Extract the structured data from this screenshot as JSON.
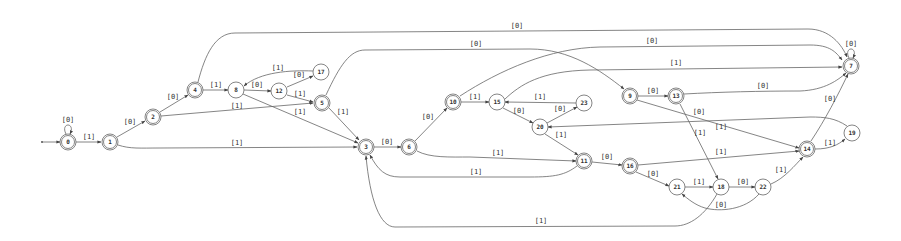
{
  "diagram": {
    "type": "finite-state-automaton",
    "start_state": "0",
    "states": [
      {
        "id": "0",
        "x": 68,
        "y": 142,
        "accepting": true
      },
      {
        "id": "1",
        "x": 110,
        "y": 142,
        "accepting": true
      },
      {
        "id": "2",
        "x": 153,
        "y": 117,
        "accepting": true
      },
      {
        "id": "4",
        "x": 195,
        "y": 90,
        "accepting": true
      },
      {
        "id": "8",
        "x": 236,
        "y": 90,
        "accepting": false
      },
      {
        "id": "12",
        "x": 279,
        "y": 91,
        "accepting": false
      },
      {
        "id": "17",
        "x": 321,
        "y": 72,
        "accepting": false
      },
      {
        "id": "5",
        "x": 322,
        "y": 103,
        "accepting": true
      },
      {
        "id": "3",
        "x": 366,
        "y": 147,
        "accepting": true
      },
      {
        "id": "6",
        "x": 409,
        "y": 147,
        "accepting": true
      },
      {
        "id": "10",
        "x": 453,
        "y": 102,
        "accepting": true
      },
      {
        "id": "15",
        "x": 497,
        "y": 102,
        "accepting": false
      },
      {
        "id": "23",
        "x": 584,
        "y": 103,
        "accepting": false
      },
      {
        "id": "20",
        "x": 540,
        "y": 127,
        "accepting": false
      },
      {
        "id": "11",
        "x": 584,
        "y": 161,
        "accepting": true
      },
      {
        "id": "16",
        "x": 630,
        "y": 166,
        "accepting": true
      },
      {
        "id": "21",
        "x": 677,
        "y": 187,
        "accepting": false
      },
      {
        "id": "18",
        "x": 721,
        "y": 187,
        "accepting": false
      },
      {
        "id": "22",
        "x": 763,
        "y": 187,
        "accepting": false
      },
      {
        "id": "9",
        "x": 630,
        "y": 96,
        "accepting": true
      },
      {
        "id": "13",
        "x": 676,
        "y": 96,
        "accepting": true
      },
      {
        "id": "14",
        "x": 807,
        "y": 149,
        "accepting": true
      },
      {
        "id": "19",
        "x": 852,
        "y": 133,
        "accepting": false
      },
      {
        "id": "7",
        "x": 851,
        "y": 66,
        "accepting": true
      }
    ],
    "edges": [
      {
        "from": "0",
        "to": "0",
        "label": "[0]",
        "path": "M66,134 C60,122 76,122 70,134",
        "lx": 68,
        "ly": 122
      },
      {
        "from": "0",
        "to": "1",
        "label": "[1]",
        "path": "M76,142 L101,142",
        "lx": 89,
        "ly": 139
      },
      {
        "from": "1",
        "to": "2",
        "label": "[0]",
        "path": "M117,137 L145,121",
        "lx": 130,
        "ly": 124
      },
      {
        "from": "1",
        "to": "3",
        "label": "[1]",
        "path": "M118,145 C130,149 140,148 160,148 L357,147",
        "lx": 237,
        "ly": 145
      },
      {
        "from": "2",
        "to": "4",
        "label": "[0]",
        "path": "M160,112 L188,95",
        "lx": 173,
        "ly": 99
      },
      {
        "from": "2",
        "to": "5",
        "label": "[1]",
        "path": "M161,116 L313,103",
        "lx": 237,
        "ly": 108
      },
      {
        "from": "4",
        "to": "7",
        "label": "[0]",
        "path": "M198,82 C205,55 215,33 235,33 L808,29 C830,29 842,45 847,57",
        "lx": 517,
        "ly": 28
      },
      {
        "from": "4",
        "to": "8",
        "label": "[1]",
        "path": "M203,90 L228,90",
        "lx": 216,
        "ly": 87
      },
      {
        "from": "8",
        "to": "12",
        "label": "[0]",
        "path": "M244,90 L271,91",
        "lx": 257,
        "ly": 87
      },
      {
        "from": "8",
        "to": "3",
        "label": "[1]",
        "path": "M243,94 L358,143",
        "lx": 300,
        "ly": 114
      },
      {
        "from": "12",
        "to": "17",
        "label": "[0]",
        "path": "M287,87 L313,76",
        "lx": 299,
        "ly": 77
      },
      {
        "from": "12",
        "to": "5",
        "label": "[1]",
        "path": "M287,95 L313,102",
        "lx": 300,
        "ly": 96
      },
      {
        "from": "17",
        "to": "8",
        "label": "[1]",
        "path": "M313,71 C290,70 260,72 244,86",
        "lx": 278,
        "ly": 70
      },
      {
        "from": "5",
        "to": "9",
        "label": "[0]",
        "path": "M326,95 C340,65 350,50 365,50 L530,49 C570,49 600,70 624,89",
        "lx": 476,
        "ly": 46
      },
      {
        "from": "5",
        "to": "3",
        "label": "[1]",
        "path": "M329,108 L359,140",
        "lx": 343,
        "ly": 114
      },
      {
        "from": "3",
        "to": "6",
        "label": "[0]",
        "path": "M374,147 L401,147",
        "lx": 387,
        "ly": 144
      },
      {
        "from": "6",
        "to": "10",
        "label": "[0]",
        "path": "M415,141 L447,108",
        "lx": 428,
        "ly": 119
      },
      {
        "from": "6",
        "to": "11",
        "label": "[1]",
        "path": "M417,151 C430,158 450,157 470,157 L576,161",
        "lx": 498,
        "ly": 155
      },
      {
        "from": "10",
        "to": "7",
        "label": "[0]",
        "path": "M460,96 C500,70 550,48 600,47 L810,45 C830,45 836,52 842,60",
        "lx": 652,
        "ly": 43
      },
      {
        "from": "10",
        "to": "15",
        "label": "[1]",
        "path": "M461,102 L489,102",
        "lx": 475,
        "ly": 99
      },
      {
        "from": "15",
        "to": "20",
        "label": "[0]",
        "path": "M503,108 L533,123",
        "lx": 519,
        "ly": 113
      },
      {
        "from": "15",
        "to": "7",
        "label": "[1]",
        "path": "M505,99 C520,85 540,71 590,70 L842,67",
        "lx": 676,
        "ly": 65
      },
      {
        "from": "23",
        "to": "15",
        "label": "[1]",
        "path": "M576,103 L505,102",
        "lx": 540,
        "ly": 99
      },
      {
        "from": "20",
        "to": "23",
        "label": "[0]",
        "path": "M547,123 L577,107",
        "lx": 560,
        "ly": 111
      },
      {
        "from": "20",
        "to": "11",
        "label": "[1]",
        "path": "M545,134 L578,155",
        "lx": 561,
        "ly": 137
      },
      {
        "from": "11",
        "to": "16",
        "label": "[0]",
        "path": "M592,162 L622,165",
        "lx": 607,
        "ly": 159
      },
      {
        "from": "11",
        "to": "3",
        "label": "[1]",
        "path": "M577,166 C565,175 555,177 530,177 L400,177 C385,177 378,170 370,155",
        "lx": 476,
        "ly": 174
      },
      {
        "from": "9",
        "to": "13",
        "label": "[0]",
        "path": "M638,96 L668,96",
        "lx": 653,
        "ly": 93
      },
      {
        "from": "9",
        "to": "14",
        "label": "[1]",
        "path": "M637,100 L799,148",
        "lx": 721,
        "ly": 129
      },
      {
        "from": "13",
        "to": "7",
        "label": "[0]",
        "path": "M684,94 C720,92 760,91 800,91 C825,90 838,80 846,73",
        "lx": 763,
        "ly": 88
      },
      {
        "from": "13",
        "to": "18",
        "label": "[1]",
        "path": "M680,104 L718,179",
        "lx": 700,
        "ly": 135
      },
      {
        "from": "16",
        "to": "14",
        "label": "[1]",
        "path": "M638,165 L799,151",
        "lx": 721,
        "ly": 154
      },
      {
        "from": "16",
        "to": "21",
        "label": "[0]",
        "path": "M636,172 L669,186",
        "lx": 653,
        "ly": 176
      },
      {
        "from": "21",
        "to": "18",
        "label": "[1]",
        "path": "M685,187 L713,187",
        "lx": 699,
        "ly": 184
      },
      {
        "from": "18",
        "to": "22",
        "label": "[0]",
        "path": "M729,187 L755,187",
        "lx": 743,
        "ly": 184
      },
      {
        "from": "18",
        "to": "3",
        "label": "[1]",
        "path": "M717,194 C705,215 690,226 675,226 L395,227 C380,227 370,200 366,156",
        "lx": 541,
        "ly": 223
      },
      {
        "from": "22",
        "to": "21",
        "label": "[0]",
        "path": "M759,194 C745,210 720,212 705,208 C695,205 688,199 682,194",
        "lx": 721,
        "ly": 207
      },
      {
        "from": "22",
        "to": "14",
        "label": "[1]",
        "path": "M771,184 C785,178 795,165 803,157",
        "lx": 781,
        "ly": 172
      },
      {
        "from": "14",
        "to": "19",
        "label": "[1]",
        "path": "M815,149 C830,149 838,145 845,139",
        "lx": 830,
        "ly": 145
      },
      {
        "from": "14",
        "to": "7",
        "label": "[0]",
        "path": "M811,141 C825,120 838,95 848,74",
        "lx": 830,
        "ly": 101
      },
      {
        "from": "19",
        "to": "20",
        "label": "[0]",
        "path": "M847,126 C835,118 825,117 810,117 L548,127",
        "lx": 699,
        "ly": 114
      },
      {
        "from": "7",
        "to": "7",
        "label": "[0]",
        "path": "M849,58 C843,46 859,46 853,58",
        "lx": 851,
        "ly": 46
      }
    ]
  }
}
